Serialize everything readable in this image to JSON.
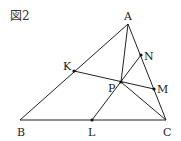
{
  "figure": {
    "label": "図2"
  },
  "points": {
    "A": {
      "name": "A",
      "x": 128,
      "y": 24,
      "lx": 124,
      "ly": 20
    },
    "B": {
      "name": "B",
      "x": 20,
      "y": 120,
      "lx": 17,
      "ly": 136
    },
    "C": {
      "name": "C",
      "x": 166,
      "y": 120,
      "lx": 163,
      "ly": 136
    },
    "K": {
      "name": "K",
      "x": 74,
      "y": 71,
      "lx": 63,
      "ly": 70
    },
    "L": {
      "name": "L",
      "x": 92,
      "y": 120,
      "lx": 88,
      "ly": 136
    },
    "M": {
      "name": "M",
      "x": 154,
      "y": 89,
      "lx": 157,
      "ly": 93
    },
    "N": {
      "name": "N",
      "x": 141,
      "y": 55,
      "lx": 144,
      "ly": 60
    },
    "P": {
      "name": "P",
      "x": 121,
      "y": 82,
      "lx": 108,
      "ly": 92
    }
  },
  "segments": [
    [
      "A",
      "B"
    ],
    [
      "B",
      "C"
    ],
    [
      "C",
      "A"
    ],
    [
      "A",
      "P"
    ],
    [
      "K",
      "M"
    ],
    [
      "L",
      "N"
    ],
    [
      "P",
      "C"
    ]
  ]
}
